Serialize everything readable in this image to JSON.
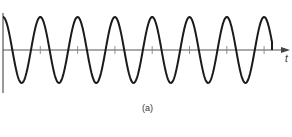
{
  "figure": {
    "axis_label": "t",
    "caption": "(a)",
    "colors": {
      "wave": "#1a1a1a",
      "axis": "#555555"
    },
    "wave": {
      "type": "cosine",
      "start_x": 3,
      "end_x": 272,
      "period_px": 37.3,
      "amplitude_px": 33,
      "baseline_y": 50
    }
  }
}
